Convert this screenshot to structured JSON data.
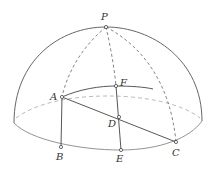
{
  "diagram": {
    "type": "spherical geometry (hemisphere)",
    "points": {
      "P": {
        "label": "P",
        "x": 106,
        "y": 27
      },
      "A": {
        "label": "A",
        "x": 62,
        "y": 97
      },
      "B": {
        "label": "B",
        "x": 61,
        "y": 147
      },
      "F": {
        "label": "F",
        "x": 116,
        "y": 86
      },
      "D": {
        "label": "D",
        "x": 119,
        "y": 117
      },
      "E": {
        "label": "E",
        "x": 121,
        "y": 150
      },
      "C": {
        "label": "C",
        "x": 176,
        "y": 142
      }
    },
    "colors": {
      "line": "#555555",
      "dashed": "#777777",
      "back_rim": "#aaaaaa"
    }
  }
}
